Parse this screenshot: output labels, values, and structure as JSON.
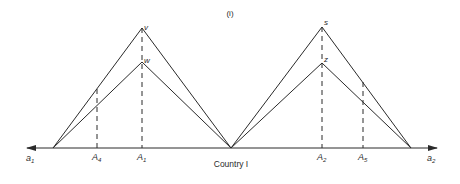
{
  "panel_label": "(i)",
  "axis": {
    "label": "Country I",
    "left_end": "a",
    "left_end_sub": "1",
    "right_end": "a",
    "right_end_sub": "2"
  },
  "peaks": {
    "v": "v",
    "w": "w",
    "s": "s",
    "z": "z"
  },
  "ticks": [
    {
      "letter": "A",
      "sub": "4"
    },
    {
      "letter": "A",
      "sub": "1"
    },
    {
      "letter": "A",
      "sub": "2"
    },
    {
      "letter": "A",
      "sub": "5"
    }
  ],
  "colors": {
    "line": "#2a2a2a",
    "background": "#ffffff"
  }
}
